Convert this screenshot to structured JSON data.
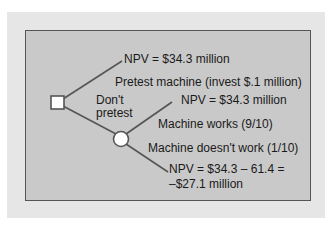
{
  "diagram": {
    "type": "decision-tree",
    "nodes": {
      "decision": {
        "shape": "square"
      },
      "chance": {
        "shape": "circle"
      }
    },
    "labels": {
      "pretest_outcome": "NPV = $34.3 million",
      "pretest_branch": "Pretest machine (invest $.1 million)",
      "dont_pretest_line1": "Don't",
      "dont_pretest_line2": "pretest",
      "works_outcome": "NPV = $34.3 million",
      "works_branch": "Machine works (9/10)",
      "fails_branch": "Machine doesn't work (1/10)",
      "fails_outcome_line1": "NPV = $34.3 – 61.4 =",
      "fails_outcome_line2": "–$27.1 million"
    },
    "colors": {
      "panel_outer": "#e6e6e6",
      "panel_inner": "#c9c9c9",
      "line": "#555555",
      "node_fill": "#ffffff"
    }
  }
}
